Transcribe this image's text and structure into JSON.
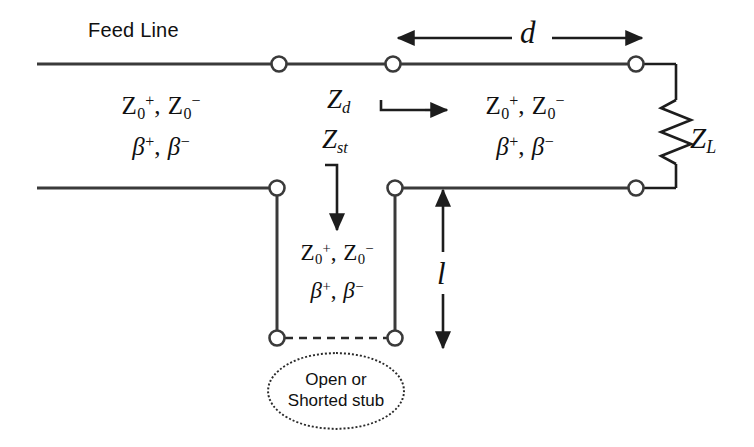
{
  "figure": {
    "background_color": "#ffffff",
    "line_color": "#3a3a3a",
    "text_color": "#101010",
    "node_fill": "#ffffff"
  },
  "labels": {
    "feed_line": "Feed Line",
    "distance_d": "d",
    "stub_length_l": "l",
    "load_impedance": "Z",
    "load_impedance_sub": "L",
    "input_impedance_d": "Z",
    "input_impedance_d_sub": "d",
    "stub_impedance": "Z",
    "stub_impedance_sub": "st"
  },
  "line_parameters": {
    "impedance_symbol": "Z",
    "impedance_sub": "0",
    "sup_plus": "+",
    "sup_minus": "−",
    "comma": ", ",
    "beta_symbol": "β"
  },
  "sections": [
    {
      "id": "feed-section",
      "name": "Feed Line section",
      "impedance_line": "Z0+, Z0−",
      "beta_line": "β+, β−"
    },
    {
      "id": "main-section",
      "name": "Line section of length d",
      "impedance_line": "Z0+, Z0−",
      "beta_line": "β+, β−"
    },
    {
      "id": "stub-section",
      "name": "Stub section of length l",
      "impedance_line": "Z0+, Z0−",
      "beta_line": "β+, β−"
    }
  ],
  "stub_bubble": {
    "line1": "Open or",
    "line2": "Shorted stub",
    "border_style": "dotted"
  },
  "annotations": {
    "d_arrow": "double-headed horizontal arrow spanning length d",
    "l_arrow": "double-headed vertical arrow spanning length l",
    "zd_arrow": "rightward arrow indicating looking-into impedance Zd",
    "zst_arrow": "downward arrow indicating stub input impedance Zst"
  },
  "terminals": [
    {
      "name": "top-junction-left",
      "x": 279,
      "y": 64
    },
    {
      "name": "top-junction-stub",
      "x": 393,
      "y": 64
    },
    {
      "name": "top-load-terminal",
      "x": 636,
      "y": 64
    },
    {
      "name": "bottom-feed-terminal",
      "x": 277,
      "y": 188
    },
    {
      "name": "bottom-stub-terminal",
      "x": 395,
      "y": 188
    },
    {
      "name": "bottom-load-terminal",
      "x": 636,
      "y": 188
    },
    {
      "name": "stub-end-left",
      "x": 277,
      "y": 338
    },
    {
      "name": "stub-end-right",
      "x": 395,
      "y": 338
    }
  ]
}
